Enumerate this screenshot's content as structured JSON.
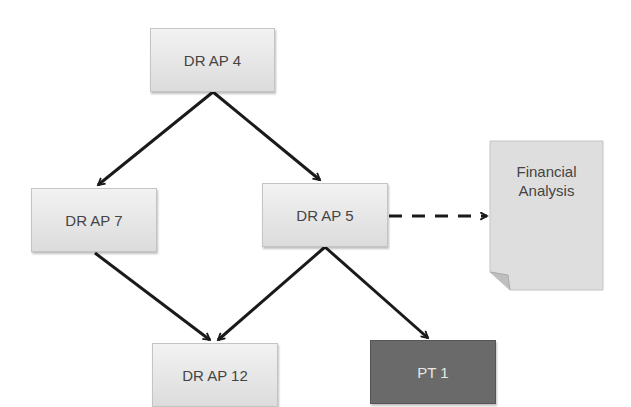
{
  "diagram": {
    "type": "flowchart",
    "nodes": [
      {
        "id": "n4",
        "label": "DR AP 4",
        "style": "light"
      },
      {
        "id": "n7",
        "label": "DR AP 7",
        "style": "light"
      },
      {
        "id": "n5",
        "label": "DR AP 5",
        "style": "light"
      },
      {
        "id": "n12",
        "label": "DR AP 12",
        "style": "light"
      },
      {
        "id": "pt1",
        "label": "PT 1",
        "style": "dark"
      },
      {
        "id": "fin",
        "label_line1": "Financial",
        "label_line2": "Analysis",
        "style": "document"
      }
    ],
    "edges": [
      {
        "from": "DR AP 4",
        "to": "DR AP 7",
        "style": "solid"
      },
      {
        "from": "DR AP 4",
        "to": "DR AP 5",
        "style": "solid"
      },
      {
        "from": "DR AP 7",
        "to": "DR AP 12",
        "style": "solid"
      },
      {
        "from": "DR AP 5",
        "to": "DR AP 12",
        "style": "solid"
      },
      {
        "from": "DR AP 5",
        "to": "PT 1",
        "style": "solid"
      },
      {
        "from": "DR AP 5",
        "to": "Financial Analysis",
        "style": "dashed"
      }
    ],
    "colors": {
      "node_light": "#e6e6e6",
      "node_dark": "#6a6a6a",
      "edge": "#1a1a1a"
    }
  }
}
